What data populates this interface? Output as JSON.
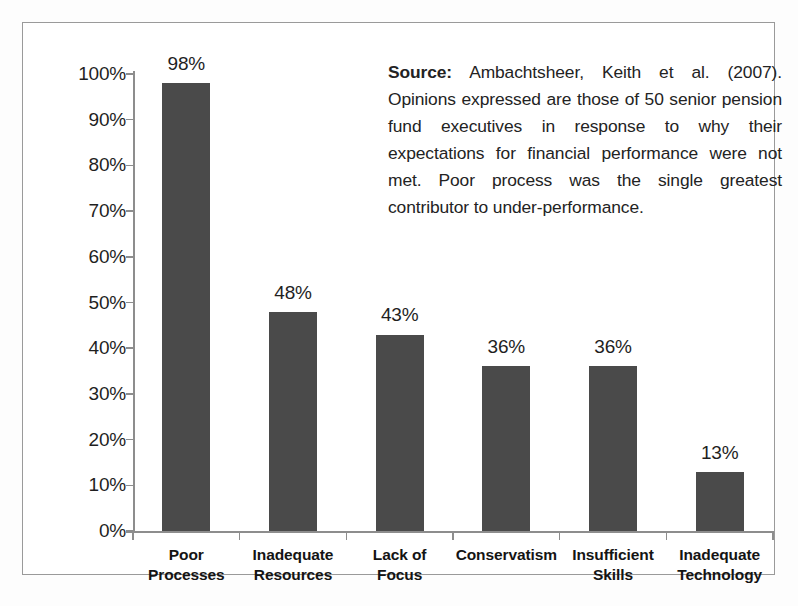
{
  "chart_data": {
    "type": "bar",
    "title": "",
    "xlabel": "",
    "ylabel": "",
    "ylim": [
      0,
      100
    ],
    "grid": false,
    "legend": "none",
    "categories": [
      "Poor Processes",
      "Inadequate Resources",
      "Lack of Focus",
      "Conservatism",
      "Insufficient Skills",
      "Inadequate Technology"
    ],
    "values": [
      98,
      48,
      43,
      36,
      36,
      13
    ],
    "data_labels": [
      "98%",
      "48%",
      "43%",
      "36%",
      "36%",
      "13%"
    ],
    "ytick_labels": [
      "100%",
      "90%",
      "80%",
      "70%",
      "60%",
      "50%",
      "40%",
      "30%",
      "20%",
      "10%",
      "0%"
    ],
    "ytick_values": [
      100,
      90,
      80,
      70,
      60,
      50,
      40,
      30,
      20,
      10,
      0
    ],
    "bar_color": "#4a4a4a",
    "axis_color": "#8d8d8d",
    "background_color": "#ffffff"
  },
  "categories_wrapped": [
    [
      "Poor",
      "Processes"
    ],
    [
      "Inadequate",
      "Resources"
    ],
    [
      "Lack of Focus"
    ],
    [
      "Conservatism"
    ],
    [
      "Insufficient",
      "Skills"
    ],
    [
      "Inadequate",
      "Technology"
    ]
  ],
  "source_note": {
    "label": "Source:",
    "text": " Ambachtsheer, Keith et al. (2007). Opinions expressed are those of 50 senior pension fund executives in response to why their expectations for financial performance were not met. Poor process was the single greatest contributor to under-performance."
  }
}
